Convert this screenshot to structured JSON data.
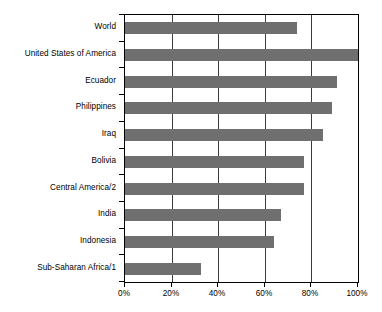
{
  "chart_data": {
    "type": "bar",
    "orientation": "horizontal",
    "title": "",
    "subtitle": "",
    "xlabel": "",
    "ylabel": "",
    "xlim": [
      0,
      100
    ],
    "grid": true,
    "legend": null,
    "legend_position": "none",
    "x_tick_labels": [
      "0%",
      "20%",
      "40%",
      "60%",
      "80%",
      "100%"
    ],
    "x_tick_values": [
      0,
      20,
      40,
      60,
      80,
      100
    ],
    "categories": [
      "World",
      "United States of America",
      "Ecuador",
      "Philippines",
      "Iraq",
      "Bolivia",
      "Central America/2",
      "India",
      "Indonesia",
      "Sub-Saharan Africa/1"
    ],
    "values": [
      74,
      100,
      91,
      89,
      85,
      77,
      77,
      67,
      64,
      32.5
    ],
    "bar_color": "#6f6f6f",
    "axis_color": "#000000",
    "grid_color": "#3c3c3c",
    "background_color": "#ffffff"
  }
}
